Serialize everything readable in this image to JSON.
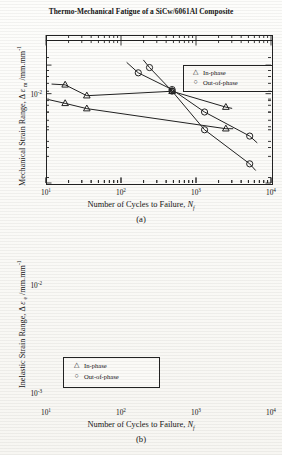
{
  "figure": {
    "title": "Thermo-Mechanical Fatigue of a SiCw/6061Al Composite"
  },
  "panels": [
    {
      "caption": "(a)",
      "xlabel_prefix": "Number of Cycles to Failure, ",
      "xlabel_symbol": "N",
      "xlabel_sub": "f",
      "ylabel_prefix": "Mechanical Strain Range, ",
      "ylabel_delta": "Δ ",
      "ylabel_eps": "ε ",
      "ylabel_sub": "m",
      "ylabel_units": " /mm.mm",
      "ylabel_exp": "-1",
      "xticks": [
        "1",
        "2",
        "3",
        "4"
      ],
      "yticks": [
        "-2"
      ],
      "legend": [
        {
          "symbol": "triangle",
          "label": "In-phase"
        },
        {
          "symbol": "circle",
          "label": "Out-of-phase"
        }
      ]
    },
    {
      "caption": "(b)",
      "xlabel_prefix": "Number of Cycles to Failure, ",
      "xlabel_symbol": "N",
      "xlabel_sub": "f",
      "ylabel_prefix": "Inelastic Strain Range, ",
      "ylabel_delta": "Δ ",
      "ylabel_eps": "ε ",
      "ylabel_sub": "e",
      "ylabel_units": " /mm.mm",
      "ylabel_exp": "-1",
      "xticks": [
        "1",
        "2",
        "3",
        "4"
      ],
      "yticks": [
        "-2",
        "-3"
      ],
      "legend": [
        {
          "symbol": "triangle",
          "label": "In-phase"
        },
        {
          "symbol": "circle",
          "label": "Out-of-phase"
        }
      ]
    }
  ],
  "chart_data": [
    {
      "type": "scatter",
      "panel": "(a)",
      "title": "Thermo-Mechanical Fatigue of a SiCw/6061Al Composite",
      "xlabel": "Number of Cycles to Failure, Nf",
      "ylabel": "Mechanical Strain Range, Δεm /mm.mm-1",
      "xscale": "log",
      "yscale": "log",
      "xlim": [
        10,
        10000
      ],
      "ylim": [
        0.0018,
        0.028
      ],
      "grid": false,
      "legend_position": "top-right",
      "series": [
        {
          "name": "In-phase",
          "marker": "triangle",
          "x": [
            18,
            35,
            2500
          ],
          "y": [
            0.0083,
            0.0075,
            0.0051
          ],
          "fit_x": [
            11,
            3100
          ],
          "fit_y": [
            0.0089,
            0.0051
          ]
        },
        {
          "name": "Out-of-phase",
          "marker": "circle",
          "x": [
            240,
            480,
            1300,
            5200
          ],
          "y": [
            0.0165,
            0.0105,
            0.005,
            0.0026
          ],
          "fit_x": [
            200,
            6200
          ],
          "fit_y": [
            0.019,
            0.0023
          ]
        }
      ]
    },
    {
      "type": "scatter",
      "panel": "(b)",
      "xlabel": "Number of Cycles to Failure, Nf",
      "ylabel": "Inelastic Strain Range, Δεe /mm.mm-1",
      "xscale": "log",
      "yscale": "log",
      "xlim": [
        10,
        10000
      ],
      "ylim": [
        0.001,
        0.018
      ],
      "grid": false,
      "legend_position": "bottom-left",
      "series": [
        {
          "name": "In-phase",
          "marker": "triangle",
          "x": [
            18,
            35,
            480,
            2500
          ],
          "y": [
            0.0068,
            0.0055,
            0.006,
            0.0044
          ],
          "fit_x": [
            12,
            3000
          ],
          "fit_y": [
            0.0069,
            0.0043
          ]
        },
        {
          "name": "Out-of-phase",
          "marker": "circle",
          "x": [
            170,
            480,
            1300,
            5200
          ],
          "y": [
            0.0086,
            0.0062,
            0.004,
            0.0025
          ],
          "fit_x": [
            120,
            6500
          ],
          "fit_y": [
            0.0105,
            0.0022
          ]
        }
      ]
    }
  ]
}
